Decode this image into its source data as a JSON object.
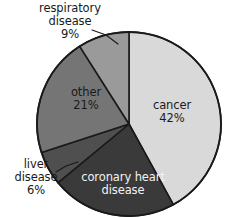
{
  "chart_data": {
    "type": "pie",
    "title": "",
    "subtitle": "",
    "xlabel": "",
    "ylabel": "",
    "legend_position": "none",
    "grid": false,
    "labels_inside": [
      "cancer",
      "coronary heart disease",
      "other"
    ],
    "labels_outside": [
      "respiratory disease",
      "liver disease"
    ],
    "start_angle_deg": 0,
    "direction": "clockwise",
    "categories": [
      "cancer",
      "coronary heart disease",
      "liver disease",
      "other",
      "respiratory disease"
    ],
    "values": [
      42,
      22,
      6,
      21,
      9
    ],
    "colors": [
      "#d9d9d9",
      "#3a3a3a",
      "#4f4f4f",
      "#757575",
      "#9a9a9a"
    ],
    "slices": [
      {
        "name": "cancer",
        "label": "cancer",
        "percent_text": "42%",
        "value": 42,
        "color": "#d9d9d9",
        "start_deg": 0,
        "end_deg": 151.2,
        "label_placement": "inside",
        "text_color": "#1a1a1a"
      },
      {
        "name": "coronary heart disease",
        "label_line1": "coronary heart",
        "label_line2": "disease",
        "percent_text": "",
        "value": 22,
        "color": "#3a3a3a",
        "start_deg": 151.2,
        "end_deg": 230.4,
        "label_placement": "inside",
        "text_color": "#f2f2f2"
      },
      {
        "name": "liver disease",
        "label_line1": "liver",
        "label_line2": "disease",
        "percent_text": "6%",
        "value": 6,
        "color": "#4f4f4f",
        "start_deg": 230.4,
        "end_deg": 252.0,
        "label_placement": "outside",
        "text_color": "#1a1a1a"
      },
      {
        "name": "other",
        "label": "other",
        "percent_text": "21%",
        "value": 21,
        "color": "#757575",
        "start_deg": 252.0,
        "end_deg": 327.6,
        "label_placement": "inside",
        "text_color": "#1a1a1a"
      },
      {
        "name": "respiratory disease",
        "label_line1": "respiratory",
        "label_line2": "disease",
        "percent_text": "9%",
        "value": 9,
        "color": "#9a9a9a",
        "start_deg": 327.6,
        "end_deg": 360.0,
        "label_placement": "outside",
        "text_color": "#1a1a1a"
      }
    ]
  },
  "labels": {
    "respiratory": {
      "line1": "respiratory",
      "line2": "disease",
      "line3": "9%"
    },
    "liver": {
      "line1": "liver",
      "line2": "disease",
      "line3": "6%"
    },
    "cancer": {
      "line1": "cancer",
      "line2": "42%"
    },
    "other": {
      "line1": "other",
      "line2": "21%"
    },
    "coronary": {
      "line1": "coronary heart",
      "line2": "disease"
    }
  },
  "geometry": {
    "center_x": 129,
    "center_y": 124,
    "radius": 92
  }
}
